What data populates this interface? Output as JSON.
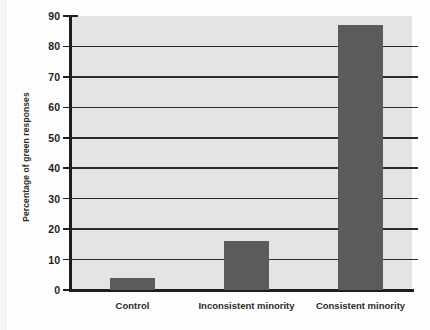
{
  "chart_data": {
    "type": "bar",
    "title": "",
    "subtitle": "",
    "xlabel": "",
    "ylabel": "Percentage of green responses",
    "categories": [
      "Control",
      "Inconsistent minority",
      "Consistent minority"
    ],
    "values": [
      4,
      16,
      87
    ],
    "series": [
      {
        "name": "Percentage of green responses",
        "values": [
          4,
          16,
          87
        ]
      }
    ],
    "ylim": [
      0,
      90
    ],
    "ytick_values": [
      0,
      10,
      20,
      30,
      40,
      50,
      60,
      70,
      80,
      90
    ],
    "ytick_labels": [
      "0",
      "10",
      "20",
      "30",
      "40",
      "50",
      "60",
      "70",
      "80",
      "90"
    ],
    "gridlines": {
      "horizontal": true,
      "vertical": false,
      "at_values": [
        10,
        20,
        30,
        40,
        50,
        60,
        70,
        80
      ]
    },
    "legend": {
      "visible": false,
      "position": "none",
      "entries": []
    },
    "annotations": [],
    "colors": {
      "bar_fill": "#5b5b5b",
      "plot_background": "#e4e4e4",
      "figure_background": "#fdfdfd",
      "axis": "#1d1d1d",
      "gridline": "#2a2a2a",
      "text": "#2b2b2b"
    }
  }
}
